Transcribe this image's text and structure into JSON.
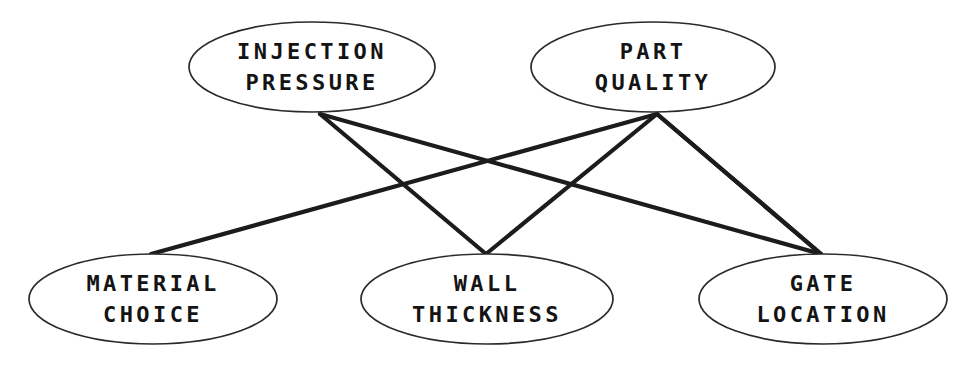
{
  "diagram": {
    "type": "bipartite-node-link-diagram",
    "background_color": "#ffffff",
    "node_fill_color": "#ffffff",
    "node_stroke_color": "#2a2a2a",
    "edge_color": "#1c1c1c",
    "text_color": "#141414",
    "nodes": [
      {
        "id": "injection-pressure",
        "line1": "INJECTION",
        "line2": "PRESSURE",
        "cx": 312,
        "cy": 67,
        "rx": 123,
        "ry": 45,
        "row": "top"
      },
      {
        "id": "part-quality",
        "line1": "PART",
        "line2": "QUALITY",
        "cx": 653,
        "cy": 67,
        "rx": 122,
        "ry": 45,
        "row": "top"
      },
      {
        "id": "material-choice",
        "line1": "MATERIAL",
        "line2": "CHOICE",
        "cx": 153,
        "cy": 299,
        "rx": 124,
        "ry": 45,
        "row": "bottom"
      },
      {
        "id": "wall-thickness",
        "line1": "WALL",
        "line2": "THICKNESS",
        "cx": 487,
        "cy": 299,
        "rx": 126,
        "ry": 45,
        "row": "bottom"
      },
      {
        "id": "gate-location",
        "line1": "GATE",
        "line2": "LOCATION",
        "cx": 823,
        "cy": 299,
        "rx": 124,
        "ry": 45,
        "row": "bottom"
      }
    ],
    "edges": [
      {
        "id": "edge-ip-mc",
        "from": "injection-pressure",
        "to": "material-choice",
        "x1": 320,
        "y1": 114,
        "x2": 151,
        "y2": 254
      },
      {
        "id": "edge-ip-wt",
        "from": "injection-pressure",
        "to": "wall-thickness",
        "x1": 320,
        "y1": 114,
        "x2": 486,
        "y2": 254
      },
      {
        "id": "edge-ip-gl",
        "from": "injection-pressure",
        "to": "gate-location",
        "x1": 320,
        "y1": 114,
        "x2": 821,
        "y2": 254
      },
      {
        "id": "edge-pq-mc",
        "from": "part-quality",
        "to": "material-choice",
        "x1": 657,
        "y1": 114,
        "x2": 151,
        "y2": 254
      },
      {
        "id": "edge-pq-wt",
        "from": "part-quality",
        "to": "wall-thickness",
        "x1": 657,
        "y1": 114,
        "x2": 486,
        "y2": 254
      },
      {
        "id": "edge-pq-gl",
        "from": "part-quality",
        "to": "gate-location",
        "x1": 657,
        "y1": 114,
        "x2": 821,
        "y2": 254
      }
    ]
  }
}
